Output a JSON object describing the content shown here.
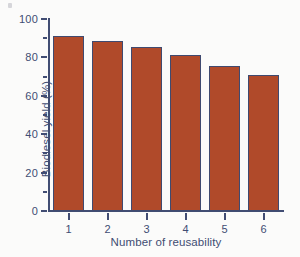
{
  "figure": {
    "background_color": "#fbfbfa",
    "axis_color": "#414d73",
    "bar_fill_color": "#b04a2a",
    "bar_edge_color": "#3f4a70"
  },
  "chart_data": {
    "type": "bar",
    "title": "",
    "xlabel": "Number of reusability",
    "ylabel": "Biodiesel yield (%)",
    "categories": [
      "1",
      "2",
      "3",
      "4",
      "5",
      "6"
    ],
    "values": [
      91,
      88.5,
      85.5,
      81,
      75.5,
      71
    ],
    "series": [
      {
        "name": "Biodiesel yield",
        "values": [
          91,
          88.5,
          85.5,
          81,
          75.5,
          71
        ]
      }
    ],
    "ylim": [
      0,
      100
    ],
    "y_major_ticks": [
      0,
      20,
      40,
      60,
      80,
      100
    ],
    "y_tick_labels": [
      "0",
      "20",
      "40",
      "60",
      "80",
      "100"
    ],
    "y_minor_ticks": [
      10,
      30,
      50,
      70,
      90
    ],
    "x_tick_labels": [
      "1",
      "2",
      "3",
      "4",
      "5",
      "6"
    ],
    "grid": false,
    "legend": false,
    "legend_position": "none"
  }
}
